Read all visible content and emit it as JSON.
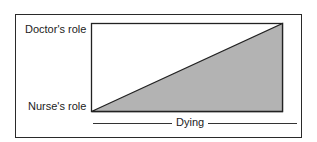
{
  "diagram": {
    "labels": {
      "top_left": "Doctor's role",
      "bottom_left": "Nurse's role",
      "x_axis": "Dying"
    },
    "colors": {
      "fill": "#b3b3b3",
      "stroke": "#222222"
    }
  }
}
